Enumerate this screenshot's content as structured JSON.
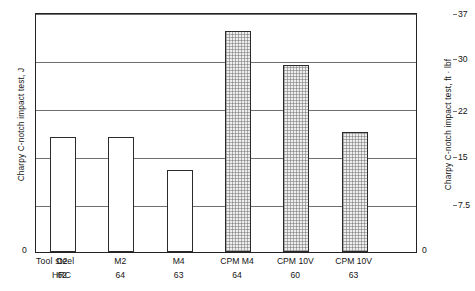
{
  "chart_data": {
    "type": "bar",
    "title": "",
    "xlabel": "",
    "ylabel": "Charpy C-notch impact test, J",
    "ylabel_right": "Charpy C-notch impact test, ft · lbf",
    "categories": [
      "D2",
      "M2",
      "M4",
      "CPM M4",
      "CPM 10V",
      "CPM 10V"
    ],
    "hrc": [
      "62",
      "64",
      "63",
      "64",
      "60",
      "63"
    ],
    "values": [
      24,
      24,
      17,
      46,
      39,
      25
    ],
    "ylim": [
      0,
      50
    ],
    "yticks": [
      "0",
      "10",
      "20",
      "30",
      "40",
      "50"
    ],
    "ylim_right": [
      0,
      37
    ],
    "yticks_right": [
      "0",
      "7.5",
      "15",
      "22",
      "30",
      "37"
    ],
    "grid": true,
    "legend": "none",
    "bar_fill": [
      "open",
      "open",
      "open",
      "hatched",
      "hatched",
      "hatched"
    ],
    "row_labels": {
      "steel": "Tool steel",
      "hrc": "HRC"
    },
    "colors": {
      "axis": "#232323",
      "grid": "#6f6f6f",
      "bar_outline": "#2b2b2b",
      "bar_open_fill": "#ffffff",
      "bar_hatch_fill": "#eeeeee",
      "text": "#141414"
    }
  }
}
